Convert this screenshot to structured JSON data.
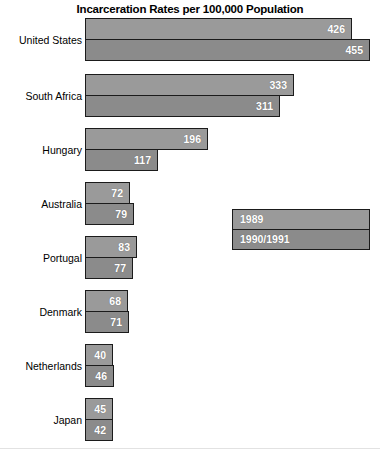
{
  "chart_data": {
    "type": "bar",
    "orientation": "horizontal",
    "title": "Incarceration Rates per 100,000 Population",
    "xlabel": "",
    "ylabel": "",
    "grid": false,
    "legend_position": "middle-right",
    "xlim": [
      0,
      455
    ],
    "categories": [
      "United States",
      "South Africa",
      "Hungary",
      "Australia",
      "Portugal",
      "Denmark",
      "Netherlands",
      "Japan"
    ],
    "series": [
      {
        "name": "1989",
        "color": "#9a9a9a",
        "values": [
          426,
          333,
          196,
          72,
          83,
          68,
          40,
          45
        ]
      },
      {
        "name": "1990/1991",
        "color": "#8b8b8b",
        "values": [
          455,
          311,
          117,
          79,
          77,
          71,
          46,
          42
        ]
      }
    ]
  },
  "legend": {
    "entries": [
      {
        "label": "1989"
      },
      {
        "label": "1990/1991"
      }
    ]
  }
}
